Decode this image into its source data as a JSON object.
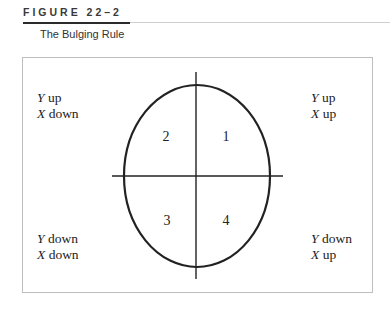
{
  "figure": {
    "label": "FIGURE 22–2",
    "title": "The Bulging Rule"
  },
  "quadrants": {
    "top_left": {
      "line1_var": "Y",
      "line1_dir": "up",
      "line2_var": "X",
      "line2_dir": "down"
    },
    "top_right": {
      "line1_var": "Y",
      "line1_dir": "up",
      "line2_var": "X",
      "line2_dir": "up"
    },
    "bottom_left": {
      "line1_var": "Y",
      "line1_dir": "down",
      "line2_var": "X",
      "line2_dir": "down"
    },
    "bottom_right": {
      "line1_var": "Y",
      "line1_dir": "down",
      "line2_var": "X",
      "line2_dir": "up"
    }
  },
  "quadrant_numbers": {
    "q1": "1",
    "q2": "2",
    "q3": "3",
    "q4": "4"
  },
  "colors": {
    "stroke": "#222222",
    "border": "#bdbdbd"
  }
}
